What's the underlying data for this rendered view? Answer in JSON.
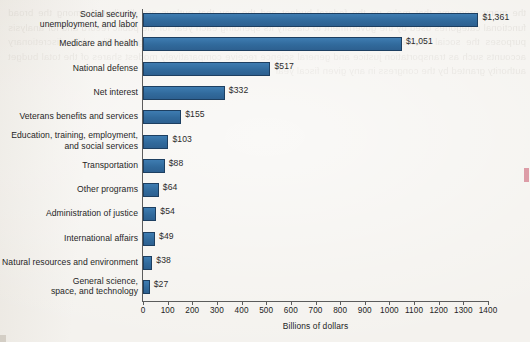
{
  "chart_data": {
    "type": "bar",
    "orientation": "horizontal",
    "title": "",
    "xlabel": "Billions of dollars",
    "ylabel": "",
    "xlim": [
      0,
      1400
    ],
    "xticks": [
      0,
      100,
      200,
      300,
      400,
      500,
      600,
      700,
      800,
      900,
      1000,
      1100,
      1200,
      1300,
      1400
    ],
    "grid": false,
    "legend": null,
    "bar_color": "#34719f",
    "bar_border_color": "#1d3f61",
    "categories": [
      "Social security,\nunemployment, and labor",
      "Medicare and health",
      "National defense",
      "Net interest",
      "Veterans benefits and services",
      "Education, training, employment,\nand social services",
      "Transportation",
      "Other programs",
      "Administration of justice",
      "International affairs",
      "Natural resources and environment",
      "General science,\nspace, and technology"
    ],
    "values": [
      1361,
      1051,
      517,
      332,
      155,
      103,
      88,
      64,
      54,
      49,
      38,
      27
    ],
    "value_labels": [
      "$1,361",
      "$1,051",
      "$517",
      "$332",
      "$155",
      "$103",
      "$88",
      "$64",
      "$54",
      "$49",
      "$38",
      "$27"
    ]
  },
  "axis": {
    "x_title": "Billions of dollars",
    "tick_labels": [
      "0",
      "100",
      "200",
      "300",
      "400",
      "500",
      "600",
      "700",
      "800",
      "900",
      "1000",
      "1100",
      "1200",
      "1300",
      "1400"
    ]
  },
  "bleed_text": "the many programs that make up the federal budget and the way that outlays are distributed among the broad functional categories used by the government to classify its spending each year for the public record and for analysis purposes the social insurance programs dominate with health care spending rising steadily while discretionary accounts such as transportation justice and general science receive comparatively modest shares of the total budget authority granted by the congress in any given fiscal year"
}
